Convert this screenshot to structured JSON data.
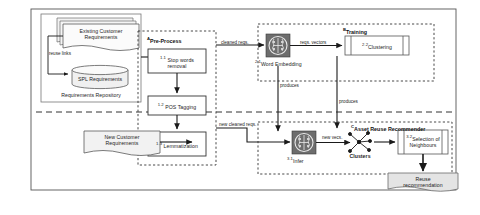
{
  "diagram": {
    "outer_frame": "system-boundary",
    "divider": "training-inference-divider"
  },
  "repository": {
    "caption": "Requirements Repository",
    "existing_docs": "Existing Customer\nRequirements",
    "existing_docs_line1": "Existing Customer",
    "existing_docs_line2": "Requirements",
    "spl_db": "SPL Requirements",
    "reuse_links": "reuse links"
  },
  "new_input": {
    "line1": "New Customer",
    "line2": "Requirements"
  },
  "groups": {
    "preprocess": {
      "tag": "A",
      "label": "Pre-Process"
    },
    "training": {
      "tag": "B",
      "label": "Training"
    },
    "recommender": {
      "tag": "C",
      "label": "Asset Reuse Recommender"
    }
  },
  "steps": {
    "stop_words": {
      "num": "1.1",
      "line1": "Stop words",
      "line2": "removal"
    },
    "pos_tagging": {
      "num": "1.2",
      "label": "POS Tagging"
    },
    "lemmatization": {
      "num": "1.3",
      "label": "Lemmatization"
    },
    "word_embedding": {
      "num": "2.1",
      "label": "Word Embedding"
    },
    "clustering": {
      "num": "2.2",
      "label": "Clustering"
    },
    "infer": {
      "num": "3.1",
      "label": "Infer"
    },
    "selection": {
      "num": "3.2",
      "line1": "Selection of",
      "line2": "Neighbours"
    }
  },
  "artifacts": {
    "clusters": "Clusters",
    "recommendation_line1": "Reuse",
    "recommendation_line2": "recommendation"
  },
  "edges": {
    "cleaned_reqs": "cleaned reqs.",
    "reqs_vectors": "reqs. vectors",
    "new_cleaned_reqs": "new cleaned reqs.",
    "new_vecs": "new vecs.",
    "produces_1": "produces",
    "produces_2": "produces"
  },
  "colors": {
    "line": "#1a1a1a",
    "doc_fill": "#f0f0f0",
    "box_fill": "#ffffff",
    "icon_fill": "#6e6e6e",
    "gray_doc": "#e3e3e3",
    "dashed": "#444444"
  }
}
